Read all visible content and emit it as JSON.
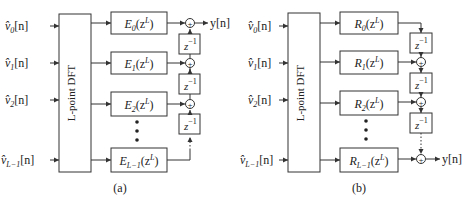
{
  "figure": {
    "panels": [
      {
        "id": "a",
        "caption": "(a)",
        "inputs": [
          {
            "base": "v̂",
            "sub": "0",
            "suffix": "[n]"
          },
          {
            "base": "v̂",
            "sub": "1",
            "suffix": "[n]"
          },
          {
            "base": "v̂",
            "sub": "2",
            "suffix": "[n]"
          },
          {
            "base": "v̂",
            "sub": "L−1",
            "suffix": "[n]"
          }
        ],
        "dft_label": "L-point DFT",
        "filters": [
          {
            "base": "E",
            "sub": "0",
            "arg": "(z",
            "sup": "L",
            "close": ")"
          },
          {
            "base": "E",
            "sub": "1",
            "arg": "(z",
            "sup": "L",
            "close": ")"
          },
          {
            "base": "E",
            "sub": "2",
            "arg": "(z",
            "sup": "L",
            "close": ")"
          },
          {
            "base": "E",
            "sub": "L−1",
            "arg": "(z",
            "sup": "L",
            "close": ")"
          }
        ],
        "delay": {
          "base": "z",
          "sup": "−1"
        },
        "adder_symbol": "+",
        "output": "y[n]"
      },
      {
        "id": "b",
        "caption": "(b)",
        "inputs": [
          {
            "base": "v̂",
            "sub": "0",
            "suffix": "[n]"
          },
          {
            "base": "v̂",
            "sub": "1",
            "suffix": "[n]"
          },
          {
            "base": "v̂",
            "sub": "2",
            "suffix": "[n]"
          },
          {
            "base": "v̂",
            "sub": "L−1",
            "suffix": "[n]"
          }
        ],
        "dft_label": "L-point DFT",
        "filters": [
          {
            "base": "R",
            "sub": "0",
            "arg": "(z",
            "sup": "L",
            "close": ")"
          },
          {
            "base": "R",
            "sub": "1",
            "arg": "(z",
            "sup": "L",
            "close": ")"
          },
          {
            "base": "R",
            "sub": "2",
            "arg": "(z",
            "sup": "L",
            "close": ")"
          },
          {
            "base": "R",
            "sub": "L−1",
            "arg": "(z",
            "sup": "L",
            "close": ")"
          }
        ],
        "delay": {
          "base": "z",
          "sup": "−1"
        },
        "adder_symbol": "+",
        "output": "y[n]"
      }
    ]
  }
}
